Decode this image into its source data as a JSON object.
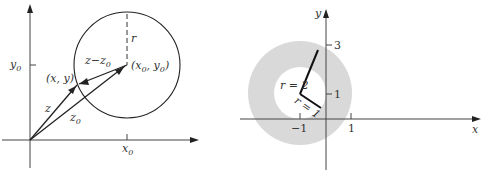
{
  "left_figure": {
    "y_tick_label": "y",
    "y_tick_sub": "0",
    "x_tick_label": "x",
    "x_tick_sub": "0",
    "radius_label": "r",
    "diff_label": "z−z",
    "diff_sub": "0",
    "point_label": "(x, y)",
    "center_label_a": "(x",
    "center_label_sub1": "0",
    "center_label_b": ", y",
    "center_label_sub2": "0",
    "center_label_c": ")",
    "z_label": "z",
    "z0_label": "z",
    "z0_sub": "0"
  },
  "right_figure": {
    "x_axis_label": "x",
    "y_axis_label": "y",
    "tick_y3": "3",
    "tick_y1": "1",
    "tick_xm1": "−1",
    "tick_x1": "1",
    "outer_radius_label": "r = 2",
    "inner_radius_label": "r = 1",
    "shade_color": "#d9d9d9"
  }
}
